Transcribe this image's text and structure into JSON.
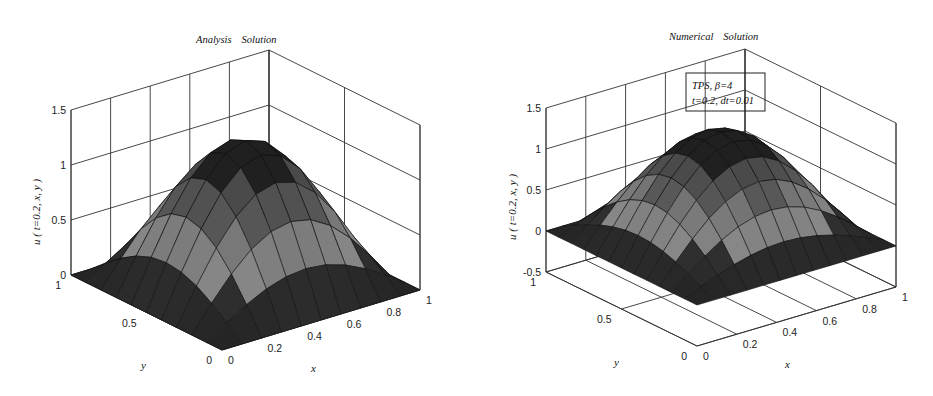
{
  "chart_data": [
    {
      "type": "surface3d",
      "title": "Analysis Solution",
      "title_parts": [
        "Analysis",
        "Solution"
      ],
      "xlabel": "x",
      "ylabel": "y",
      "zlabel": "u ( t=0.2, x, y )",
      "x_ticks": [
        "0",
        "0.2",
        "0.4",
        "0.6",
        "0.8",
        "1"
      ],
      "y_ticks": [
        "0",
        "0.5",
        "1"
      ],
      "z_ticks": [
        "0",
        "0.5",
        "1",
        "1.5"
      ],
      "xlim": [
        0,
        1
      ],
      "ylim": [
        0,
        1
      ],
      "zlim": [
        0,
        1.5
      ],
      "grid": true,
      "function": "u = A*sin(pi*x)*sin(pi*y)",
      "peak_value": 1.29,
      "mesh_n": 10,
      "geometry": {
        "front": [
          222,
          350
        ],
        "left": [
          71,
          275
        ],
        "right": [
          420,
          290
        ],
        "z_px_per_unit": 110
      }
    },
    {
      "type": "surface3d",
      "title": "Numerical Solution",
      "title_parts": [
        "Numerical",
        "Solution"
      ],
      "xlabel": "x",
      "ylabel": "y",
      "zlabel": "u ( t=0.2, x, y )",
      "x_ticks": [
        "0",
        "0.2",
        "0.4",
        "0.6",
        "0.8",
        "1"
      ],
      "y_ticks": [
        "0",
        "0.5",
        "1"
      ],
      "z_ticks": [
        "-0.5",
        "0",
        "0.5",
        "1",
        "1.5"
      ],
      "xlim": [
        0,
        1
      ],
      "ylim": [
        0,
        1
      ],
      "zlim": [
        -0.5,
        1.5
      ],
      "grid": true,
      "function": "u = A*sin(pi*x)*sin(pi*y)",
      "peak_value": 1.3,
      "mesh_n": 12,
      "legend": {
        "line1": "TPS,     β=4",
        "line2": "t=0.2, dt=0.01"
      },
      "geometry": {
        "front": [
          697,
          346
        ],
        "left": [
          546,
          272
        ],
        "right": [
          896,
          287
        ],
        "z_px_per_unit": 82
      }
    }
  ],
  "colors": {
    "axis": "#333333",
    "surface_dark": "#1a1a1a",
    "surface_light": "#9a9a9a"
  }
}
